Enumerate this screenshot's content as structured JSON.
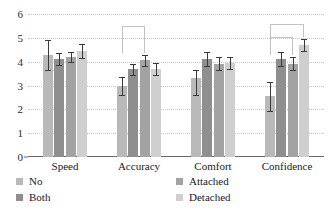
{
  "chart_data": {
    "type": "bar",
    "title": "",
    "xlabel": "",
    "ylabel": "",
    "categories": [
      "Speed",
      "Accuracy",
      "Comfort",
      "Confidence"
    ],
    "ylim": [
      0,
      6
    ],
    "yticks": [
      "6",
      "5",
      "4",
      "3",
      "2",
      "1",
      "0"
    ],
    "grid": true,
    "legend_position": "bottom",
    "series": [
      {
        "name": "No",
        "color": "#b9b9b9",
        "values": [
          4.3,
          3.0,
          3.3,
          2.55
        ],
        "err_low": [
          3.65,
          2.6,
          2.6,
          1.95
        ],
        "err_high": [
          4.9,
          3.35,
          3.65,
          3.15
        ]
      },
      {
        "name": "Both",
        "color": "#8f8f8f",
        "values": [
          4.1,
          3.7,
          4.1,
          4.1
        ],
        "err_low": [
          3.85,
          3.45,
          3.8,
          3.8
        ],
        "err_high": [
          4.35,
          3.9,
          4.4,
          4.4
        ]
      },
      {
        "name": "Attached",
        "color": "#a3a3a3",
        "values": [
          4.2,
          4.05,
          3.9,
          3.9
        ],
        "err_low": [
          4.0,
          3.8,
          3.65,
          3.65
        ],
        "err_high": [
          4.4,
          4.3,
          4.2,
          4.2
        ]
      },
      {
        "name": "Detached",
        "color": "#cfcfcf",
        "values": [
          4.45,
          3.7,
          3.95,
          4.7
        ],
        "err_low": [
          4.15,
          3.45,
          3.7,
          4.45
        ],
        "err_high": [
          4.75,
          3.95,
          4.2,
          4.95
        ]
      }
    ],
    "annotations": [
      {
        "name": "accuracy-bracket",
        "group": "Accuracy",
        "from_series": "No",
        "to_series": "Attached",
        "y": 5.5
      },
      {
        "name": "confidence-bracket-outer",
        "group": "Confidence",
        "from_series": "No",
        "to_series": "Detached",
        "y": 5.6
      },
      {
        "name": "confidence-bracket-inner",
        "group": "Confidence",
        "from_series": "No",
        "to_series": "Attached",
        "y": 5.05
      }
    ],
    "legend": [
      {
        "label": "No",
        "color": "#b9b9b9"
      },
      {
        "label": "Attached",
        "color": "#a3a3a3"
      },
      {
        "label": "Both",
        "color": "#8f8f8f"
      },
      {
        "label": "Detached",
        "color": "#cfcfcf"
      }
    ]
  }
}
